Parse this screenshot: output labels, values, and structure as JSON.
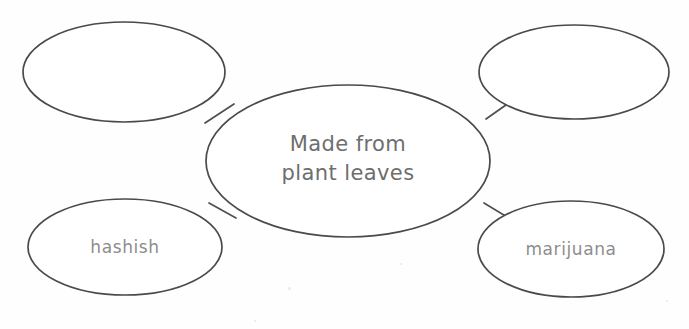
{
  "document": {
    "type": "concept-map-worksheet",
    "background_color": "#fefefe",
    "ink_color": "#4a4a4a",
    "center_text_color": "#6e6e6e",
    "leaf_text_color": "#8d8d8d"
  },
  "diagram": {
    "title": "",
    "center": {
      "id": "center",
      "label": "Made from\nplant leaves",
      "line1": "Made from",
      "line2": "plant leaves",
      "filled": true
    },
    "nodes": [
      {
        "id": "top-left",
        "position": "top-left",
        "label": "",
        "filled": false
      },
      {
        "id": "top-right",
        "position": "top-right",
        "label": "",
        "filled": false
      },
      {
        "id": "bottom-left",
        "position": "bottom-left",
        "label": "hashish",
        "filled": true
      },
      {
        "id": "bottom-right",
        "position": "bottom-right",
        "label": "marijuana",
        "filled": true
      }
    ],
    "connector_count": 4
  }
}
